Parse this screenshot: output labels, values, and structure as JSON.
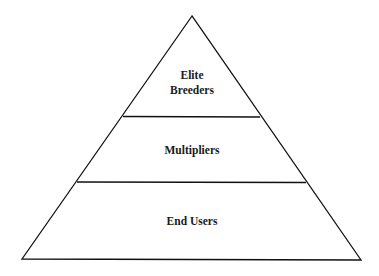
{
  "diagram": {
    "type": "pyramid",
    "tiers": [
      {
        "label_lines": [
          "Elite",
          "Breeders"
        ]
      },
      {
        "label_lines": [
          "Multipliers"
        ]
      },
      {
        "label_lines": [
          "End Users"
        ]
      }
    ],
    "colors": {
      "stroke": "#111111",
      "fill": "#ffffff",
      "text": "#1a1a1a"
    }
  }
}
